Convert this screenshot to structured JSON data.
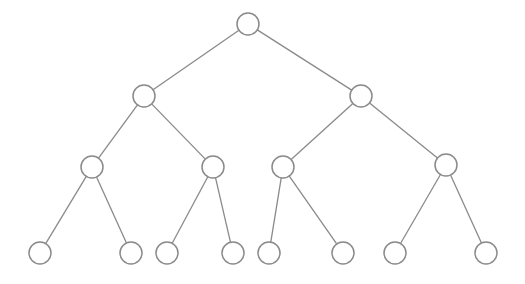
{
  "diagram": {
    "type": "binary-tree",
    "levels": 4,
    "style": {
      "background": "#ffffff",
      "stroke": "#8a8a8a",
      "node_fill": "#ffffff",
      "node_radius": 11
    },
    "nodes": [
      {
        "id": "n0",
        "level": 0,
        "x": 248,
        "y": 24
      },
      {
        "id": "n1",
        "level": 1,
        "x": 144,
        "y": 96
      },
      {
        "id": "n2",
        "level": 1,
        "x": 361,
        "y": 96
      },
      {
        "id": "n3",
        "level": 2,
        "x": 92,
        "y": 167
      },
      {
        "id": "n4",
        "level": 2,
        "x": 213,
        "y": 167
      },
      {
        "id": "n5",
        "level": 2,
        "x": 283,
        "y": 167
      },
      {
        "id": "n6",
        "level": 2,
        "x": 446,
        "y": 165
      },
      {
        "id": "n7",
        "level": 3,
        "x": 40,
        "y": 253
      },
      {
        "id": "n8",
        "level": 3,
        "x": 131,
        "y": 253
      },
      {
        "id": "n9",
        "level": 3,
        "x": 167,
        "y": 253
      },
      {
        "id": "n10",
        "level": 3,
        "x": 233,
        "y": 253
      },
      {
        "id": "n11",
        "level": 3,
        "x": 269,
        "y": 253
      },
      {
        "id": "n12",
        "level": 3,
        "x": 343,
        "y": 253
      },
      {
        "id": "n13",
        "level": 3,
        "x": 395,
        "y": 253
      },
      {
        "id": "n14",
        "level": 3,
        "x": 486,
        "y": 253
      }
    ],
    "edges": [
      [
        "n0",
        "n1"
      ],
      [
        "n0",
        "n2"
      ],
      [
        "n1",
        "n3"
      ],
      [
        "n1",
        "n4"
      ],
      [
        "n2",
        "n5"
      ],
      [
        "n2",
        "n6"
      ],
      [
        "n3",
        "n7"
      ],
      [
        "n3",
        "n8"
      ],
      [
        "n4",
        "n9"
      ],
      [
        "n4",
        "n10"
      ],
      [
        "n5",
        "n11"
      ],
      [
        "n5",
        "n12"
      ],
      [
        "n6",
        "n13"
      ],
      [
        "n6",
        "n14"
      ]
    ]
  }
}
